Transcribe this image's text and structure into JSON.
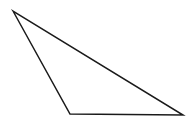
{
  "diagram": {
    "type": "triangle",
    "background": "#ffffff",
    "stroke_color": "#1a1a1a",
    "fill_color": "none",
    "stroke_width": 1.5,
    "vertices": [
      {
        "name": "A",
        "x": 13,
        "y": 11
      },
      {
        "name": "B",
        "x": 70,
        "y": 114
      },
      {
        "name": "C",
        "x": 183,
        "y": 115
      }
    ]
  }
}
